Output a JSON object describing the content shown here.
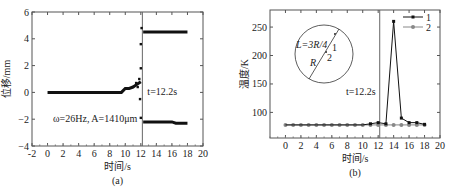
{
  "chart_data": [
    {
      "type": "scatter",
      "panel_label": "(a)",
      "title": "",
      "xlabel": "时间/s",
      "ylabel": "位移/mm",
      "xlim": [
        -2,
        20
      ],
      "ylim": [
        -4,
        6
      ],
      "xticks": [
        "-2",
        "0",
        "2",
        "4",
        "6",
        "8",
        "10",
        "12",
        "14",
        "16",
        "18",
        "20"
      ],
      "yticks": [
        "-4",
        "-2",
        "0",
        "2",
        "4",
        "6"
      ],
      "grid": false,
      "annotations": [
        "t=12.2s",
        "ω=26Hz, A=1410μm"
      ],
      "vline_x": 12.2,
      "series": [
        {
          "name": "displacement-upper",
          "x": [
            0,
            2,
            4,
            6,
            8,
            9.5,
            10,
            10.5,
            11,
            11.5,
            12,
            12.2,
            12.3,
            12.5,
            13,
            14,
            15,
            16,
            17,
            18
          ],
          "values": [
            0,
            0,
            0,
            0,
            0,
            0,
            0.3,
            0.3,
            0.4,
            0.6,
            0.8,
            4.8,
            4.5,
            4.5,
            4.5,
            4.5,
            4.5,
            4.5,
            4.5,
            4.5
          ]
        },
        {
          "name": "displacement-lower",
          "x": [
            11.5,
            12,
            12.1,
            12.2,
            12.3,
            12.5,
            13,
            14,
            15,
            16,
            16.5,
            17,
            18
          ],
          "values": [
            0.2,
            -0.5,
            -1.5,
            -2.1,
            -2.2,
            -2.2,
            -2.2,
            -2.2,
            -2.2,
            -2.2,
            -2.3,
            -2.3,
            -2.3
          ]
        }
      ]
    },
    {
      "type": "line",
      "panel_label": "(b)",
      "title": "",
      "xlabel": "时间/s",
      "ylabel": "温度/K",
      "xlim": [
        -2,
        20
      ],
      "ylim": [
        55,
        280
      ],
      "xticks": [
        "0",
        "2",
        "4",
        "6",
        "8",
        "10",
        "12",
        "14",
        "16",
        "18",
        "20"
      ],
      "yticks": [
        "100",
        "150",
        "200",
        "250"
      ],
      "grid": false,
      "legend": [
        "1",
        "2"
      ],
      "legend_position": "upper right",
      "annotations": [
        "t=12.2s",
        "L=3R/4",
        "R",
        "1",
        "2"
      ],
      "vline_x": 12.2,
      "series": [
        {
          "name": "1",
          "x": [
            0,
            1,
            2,
            3,
            4,
            5,
            6,
            7,
            8,
            9,
            10,
            11,
            12,
            13,
            14,
            15,
            16,
            17,
            18
          ],
          "values": [
            78,
            78,
            78,
            78,
            78,
            78,
            78,
            78,
            78,
            78,
            78,
            80,
            82,
            80,
            260,
            90,
            82,
            82,
            79
          ]
        },
        {
          "name": "2",
          "x": [
            0,
            1,
            2,
            3,
            4,
            5,
            6,
            7,
            8,
            9,
            10,
            11,
            12,
            13,
            14,
            15,
            16,
            17,
            18
          ],
          "values": [
            78,
            78,
            78,
            78,
            78,
            78,
            78,
            78,
            78,
            78,
            78,
            78,
            78,
            78,
            78,
            78,
            78,
            78,
            78
          ]
        }
      ]
    }
  ]
}
